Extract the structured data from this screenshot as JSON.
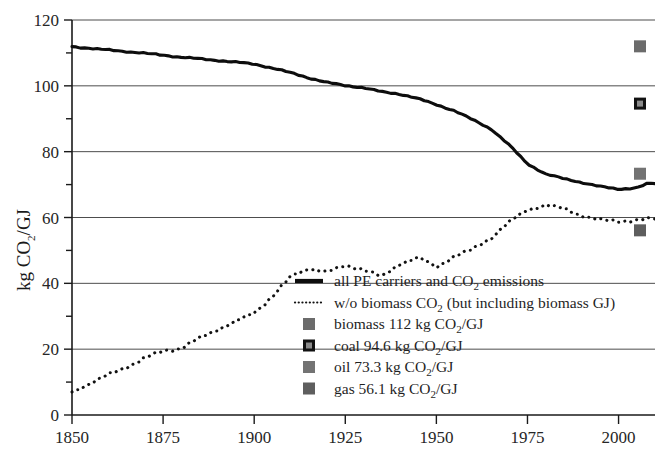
{
  "chart_data": {
    "type": "line",
    "title": "",
    "xlabel": "",
    "ylabel": "kg CO2/GJ",
    "ylabel_parts": {
      "pre": "kg CO",
      "sub": "2",
      "post": "/GJ"
    },
    "xlim": [
      1850,
      2010
    ],
    "ylim": [
      0,
      120
    ],
    "xticks": [
      1850,
      1875,
      1900,
      1925,
      1950,
      1975,
      2000
    ],
    "yticks": [
      0,
      20,
      40,
      60,
      80,
      100,
      120
    ],
    "ytick_labels": [
      "0",
      "20",
      "40",
      "60",
      "80",
      "100",
      "120"
    ],
    "xtick_labels": [
      "1850",
      "1875",
      "1900",
      "1925",
      "1950",
      "1975",
      "2000"
    ],
    "minor_ytick_step": 10,
    "grid": "horizontal-major-20",
    "legend_position": "inside-lower-center",
    "series": [
      {
        "name": "all PE carriers and CO2 emissions",
        "style": "solid",
        "color": "#0d0d0d",
        "x": [
          1850,
          1855,
          1860,
          1865,
          1870,
          1875,
          1880,
          1885,
          1890,
          1895,
          1900,
          1905,
          1910,
          1915,
          1920,
          1925,
          1930,
          1935,
          1940,
          1945,
          1950,
          1955,
          1960,
          1965,
          1970,
          1975,
          1980,
          1985,
          1990,
          1995,
          2000,
          2005,
          2008
        ],
        "values": [
          111.9,
          111.4,
          110.9,
          110.4,
          109.9,
          109.3,
          108.7,
          108.2,
          107.7,
          107.2,
          106.6,
          105.4,
          104.0,
          102.4,
          101.0,
          100.1,
          99.4,
          98.2,
          97.5,
          96.1,
          94.3,
          92.4,
          89.7,
          86.9,
          82.0,
          76.3,
          73.2,
          71.8,
          70.6,
          69.4,
          68.6,
          69.0,
          70.3
        ]
      },
      {
        "name": "w/o biomass CO2 (but including biomass GJ)",
        "style": "dotted",
        "color": "#111111",
        "x": [
          1850,
          1855,
          1860,
          1865,
          1870,
          1875,
          1880,
          1885,
          1890,
          1895,
          1900,
          1905,
          1910,
          1915,
          1920,
          1925,
          1930,
          1935,
          1940,
          1945,
          1950,
          1955,
          1960,
          1965,
          1970,
          1975,
          1980,
          1985,
          1990,
          1995,
          2000,
          2005,
          2008
        ],
        "values": [
          7.0,
          9.6,
          12.2,
          14.6,
          17.2,
          19.6,
          20.2,
          23.4,
          26.0,
          28.4,
          31.0,
          36.0,
          42.0,
          44.6,
          43.4,
          45.4,
          44.2,
          42.0,
          46.0,
          47.8,
          45.0,
          48.2,
          50.4,
          53.8,
          58.6,
          62.4,
          63.8,
          62.6,
          60.6,
          59.2,
          58.8,
          59.2,
          59.6
        ]
      }
    ],
    "reference_markers": [
      {
        "label": "biomass",
        "value": 112,
        "unit": "kg CO2/GJ",
        "color": "#6b6b6b",
        "style": "filled"
      },
      {
        "label": "coal",
        "value": 94.6,
        "unit": "kg CO2/GJ",
        "color": "#111111",
        "style": "outlined"
      },
      {
        "label": "oil",
        "value": 73.3,
        "unit": "kg CO2/GJ",
        "color": "#737373",
        "style": "filled"
      },
      {
        "label": "gas",
        "value": 56.1,
        "unit": "kg CO2/GJ",
        "color": "#5e5e5e",
        "style": "filled"
      }
    ],
    "legend": [
      {
        "key": "solid-line",
        "pre": "all PE carriers and CO",
        "sub": "2",
        "post": " emissions"
      },
      {
        "key": "dotted-line",
        "pre": "w/o biomass CO",
        "sub": "2",
        "post": " (but including biomass GJ)"
      },
      {
        "key": "biomass-marker",
        "pre": "biomass 112 kg CO",
        "sub": "2",
        "post": "/GJ"
      },
      {
        "key": "coal-marker",
        "pre": "coal 94.6 kg CO",
        "sub": "2",
        "post": "/GJ"
      },
      {
        "key": "oil-marker",
        "pre": "oil 73.3 kg CO",
        "sub": "2",
        "post": "/GJ"
      },
      {
        "key": "gas-marker",
        "pre": "gas 56.1 kg CO",
        "sub": "2",
        "post": "/GJ"
      }
    ]
  }
}
